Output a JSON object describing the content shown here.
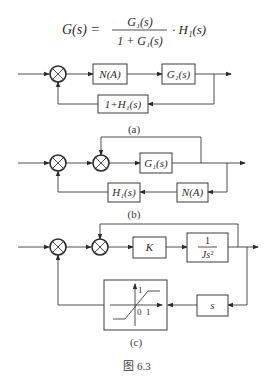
{
  "formula": {
    "lhs": "G(s) =",
    "numerator": "G₁(s)",
    "denominator": "1 + G₁(s)",
    "rhs": "· H₁(s)"
  },
  "diagram_a": {
    "blocks": [
      "N(A)",
      "G₁(s)",
      "1+H₁(s)"
    ],
    "caption": "(a)"
  },
  "diagram_b": {
    "blocks": [
      "G₁(s)",
      "H₁(s)",
      "N(A)"
    ],
    "caption": "(b)"
  },
  "diagram_c": {
    "blocks": [
      "K",
      "1",
      "Js²",
      "s"
    ],
    "saturation": {
      "y_label": "1",
      "x_label": "1",
      "origin_label": "0"
    },
    "caption": "(c)"
  },
  "figure_caption": "图 6.3"
}
